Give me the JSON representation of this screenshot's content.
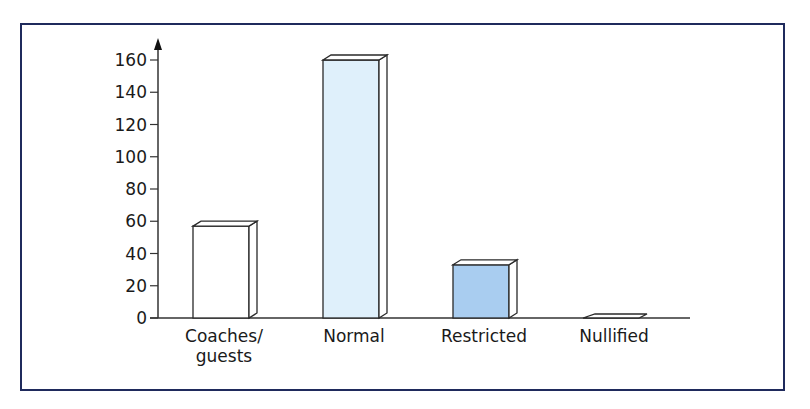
{
  "chart_data": {
    "type": "bar",
    "title": "",
    "xlabel": "",
    "ylabel": "",
    "categories": [
      "Coaches/\nguests",
      "Normal",
      "Restricted",
      "Nullified"
    ],
    "category_lines": [
      [
        "Coaches/",
        "guests"
      ],
      [
        "Normal"
      ],
      [
        "Restricted"
      ],
      [
        "Nullified"
      ]
    ],
    "values": [
      57,
      160,
      33,
      0
    ],
    "fills": [
      "#ffffff",
      "#dff0fb",
      "#a9cdf0",
      "#ffffff"
    ],
    "ylim": [
      0,
      160
    ],
    "yticks": [
      0,
      20,
      40,
      60,
      80,
      100,
      120,
      140,
      160
    ],
    "grid": false,
    "legend": null,
    "style": "3d-bar"
  },
  "colors": {
    "frame_border": "#1f2a5c",
    "axis": "#333333",
    "bar_outline": "#2a2a2a"
  }
}
